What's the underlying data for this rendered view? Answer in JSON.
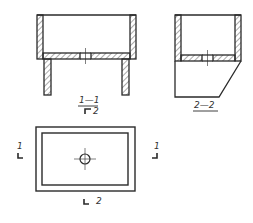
{
  "drawing": {
    "section_1": {
      "label": "1—1",
      "sub_label": "2",
      "sub_symbol": "view-arrow"
    },
    "section_2": {
      "label": "2—2"
    },
    "plan_view": {
      "cut_marker_left": "1",
      "cut_marker_right": "1",
      "cut_marker_bottom": "2"
    }
  },
  "colors": {
    "line": "#2a2a2a",
    "background": "#ffffff"
  }
}
